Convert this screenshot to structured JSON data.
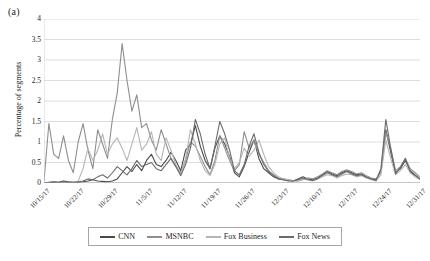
{
  "panel": {
    "label": "(a)"
  },
  "axes": {
    "ylabel": "Percentage of segments",
    "xlabel": "",
    "yticks": [
      "0",
      "0.5",
      "1",
      "1.5",
      "2",
      "2.5",
      "3",
      "3.5",
      "4"
    ],
    "xticks": [
      "10/15/17",
      "10/22/17",
      "10/29/17",
      "11/5/17",
      "11/12/17",
      "11/19/17",
      "11/26/17",
      "12/3/17",
      "12/10/17",
      "12/17/17",
      "12/24/17",
      "12/31/17"
    ]
  },
  "legend": {
    "position": "bottom",
    "items": [
      {
        "label": "CNN",
        "color": "#4a4a4a"
      },
      {
        "label": "MSNBC",
        "color": "#8e8e8e"
      },
      {
        "label": "Fox Business",
        "color": "#b5b5b5"
      },
      {
        "label": "Fox News",
        "color": "#6b6b6b"
      }
    ]
  },
  "chart_data": {
    "type": "line",
    "title": "",
    "subtitle": "",
    "xlabel": "",
    "ylabel": "Percentage of segments",
    "ylim": [
      0,
      4
    ],
    "grid": "horizontal",
    "legend_position": "bottom",
    "categories": [
      "10/15/17",
      "10/16/17",
      "10/17/17",
      "10/18/17",
      "10/19/17",
      "10/20/17",
      "10/21/17",
      "10/22/17",
      "10/23/17",
      "10/24/17",
      "10/25/17",
      "10/26/17",
      "10/27/17",
      "10/28/17",
      "10/29/17",
      "10/30/17",
      "10/31/17",
      "11/1/17",
      "11/2/17",
      "11/3/17",
      "11/4/17",
      "11/5/17",
      "11/6/17",
      "11/7/17",
      "11/8/17",
      "11/9/17",
      "11/10/17",
      "11/11/17",
      "11/12/17",
      "11/13/17",
      "11/14/17",
      "11/15/17",
      "11/16/17",
      "11/17/17",
      "11/18/17",
      "11/19/17",
      "11/20/17",
      "11/21/17",
      "11/22/17",
      "11/23/17",
      "11/24/17",
      "11/25/17",
      "11/26/17",
      "11/27/17",
      "11/28/17",
      "11/29/17",
      "11/30/17",
      "12/1/17",
      "12/2/17",
      "12/3/17",
      "12/4/17",
      "12/5/17",
      "12/6/17",
      "12/7/17",
      "12/8/17",
      "12/9/17",
      "12/10/17",
      "12/11/17",
      "12/12/17",
      "12/13/17",
      "12/14/17",
      "12/15/17",
      "12/16/17",
      "12/17/17",
      "12/18/17",
      "12/19/17",
      "12/20/17",
      "12/21/17",
      "12/22/17",
      "12/23/17",
      "12/24/17",
      "12/25/17",
      "12/26/17",
      "12/27/17",
      "12/28/17",
      "12/29/17",
      "12/30/17",
      "12/31/17"
    ],
    "series": [
      {
        "name": "CNN",
        "color": "#4a4a4a",
        "values": [
          0.0,
          0.02,
          0.03,
          0.02,
          0.05,
          0.03,
          0.02,
          0.02,
          0.03,
          0.05,
          0.08,
          0.05,
          0.04,
          0.03,
          0.05,
          0.1,
          0.25,
          0.4,
          0.28,
          0.45,
          0.3,
          0.55,
          0.7,
          0.45,
          0.4,
          0.55,
          0.75,
          0.55,
          0.3,
          0.8,
          0.95,
          1.4,
          0.9,
          0.55,
          0.35,
          0.85,
          1.15,
          0.95,
          0.65,
          0.25,
          0.15,
          0.4,
          0.75,
          1.05,
          0.6,
          0.35,
          0.25,
          0.15,
          0.1,
          0.08,
          0.06,
          0.05,
          0.1,
          0.15,
          0.1,
          0.08,
          0.12,
          0.2,
          0.28,
          0.22,
          0.18,
          0.25,
          0.3,
          0.25,
          0.2,
          0.22,
          0.15,
          0.1,
          0.08,
          0.3,
          1.3,
          0.75,
          0.25,
          0.35,
          0.55,
          0.3,
          0.2,
          0.1
        ]
      },
      {
        "name": "MSNBC",
        "color": "#8e8e8e",
        "values": [
          0.05,
          1.45,
          0.7,
          0.6,
          1.15,
          0.55,
          0.25,
          1.0,
          1.45,
          0.8,
          0.35,
          1.3,
          0.95,
          0.6,
          1.55,
          2.2,
          3.4,
          2.5,
          1.75,
          2.15,
          1.35,
          1.45,
          1.05,
          0.8,
          1.3,
          0.95,
          0.6,
          0.4,
          0.25,
          0.55,
          1.0,
          0.9,
          0.65,
          0.4,
          0.2,
          0.55,
          1.15,
          0.85,
          0.55,
          0.3,
          0.45,
          1.25,
          0.85,
          1.05,
          0.7,
          0.5,
          0.3,
          0.2,
          0.12,
          0.1,
          0.08,
          0.06,
          0.05,
          0.08,
          0.12,
          0.1,
          0.15,
          0.22,
          0.3,
          0.25,
          0.2,
          0.28,
          0.32,
          0.28,
          0.22,
          0.25,
          0.18,
          0.12,
          0.1,
          0.25,
          1.25,
          0.85,
          0.3,
          0.4,
          0.6,
          0.35,
          0.25,
          0.15
        ]
      },
      {
        "name": "Fox Business",
        "color": "#b5b5b5",
        "values": [
          0.0,
          0.0,
          0.0,
          0.0,
          0.0,
          0.0,
          0.0,
          0.05,
          0.35,
          0.85,
          0.55,
          0.8,
          1.2,
          0.7,
          0.95,
          1.1,
          0.85,
          0.55,
          0.95,
          1.35,
          0.8,
          0.95,
          1.25,
          0.7,
          0.55,
          1.1,
          0.8,
          0.45,
          0.2,
          0.6,
          1.3,
          0.95,
          0.55,
          0.3,
          0.18,
          0.45,
          0.95,
          1.1,
          0.6,
          0.35,
          0.5,
          0.85,
          0.65,
          0.8,
          1.05,
          0.7,
          0.4,
          0.25,
          0.15,
          0.1,
          0.08,
          0.05,
          0.05,
          0.1,
          0.08,
          0.05,
          0.1,
          0.15,
          0.2,
          0.18,
          0.12,
          0.18,
          0.22,
          0.2,
          0.15,
          0.18,
          0.12,
          0.08,
          0.05,
          0.2,
          1.05,
          0.6,
          0.2,
          0.3,
          0.45,
          0.25,
          0.15,
          0.08
        ]
      },
      {
        "name": "Fox News",
        "color": "#6b6b6b",
        "values": [
          0.0,
          0.0,
          0.02,
          0.02,
          0.03,
          0.02,
          0.02,
          0.03,
          0.05,
          0.1,
          0.08,
          0.15,
          0.2,
          0.12,
          0.25,
          0.4,
          0.3,
          0.2,
          0.35,
          0.55,
          0.4,
          0.45,
          0.5,
          0.35,
          0.3,
          0.45,
          0.6,
          0.4,
          0.18,
          0.45,
          0.85,
          1.55,
          1.2,
          0.7,
          0.35,
          0.9,
          1.5,
          1.2,
          0.8,
          0.3,
          0.2,
          0.45,
          0.9,
          1.2,
          0.75,
          0.45,
          0.28,
          0.18,
          0.1,
          0.08,
          0.05,
          0.05,
          0.08,
          0.12,
          0.08,
          0.06,
          0.1,
          0.18,
          0.25,
          0.2,
          0.15,
          0.22,
          0.28,
          0.22,
          0.18,
          0.2,
          0.14,
          0.1,
          0.06,
          0.35,
          1.55,
          0.85,
          0.22,
          0.38,
          0.6,
          0.28,
          0.18,
          0.1
        ]
      }
    ]
  }
}
